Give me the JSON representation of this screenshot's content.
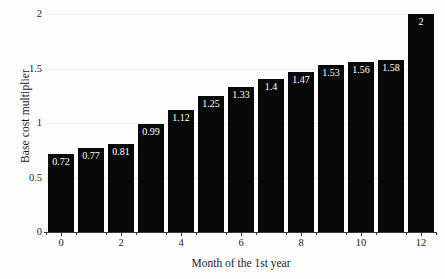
{
  "chart_data": {
    "type": "bar",
    "title": "",
    "xlabel": "Month of the 1st year",
    "ylabel": "Base cost multiplier",
    "categories": [
      0,
      1,
      2,
      3,
      4,
      5,
      6,
      7,
      8,
      9,
      10,
      11,
      12
    ],
    "values": [
      0.72,
      0.77,
      0.81,
      0.99,
      1.12,
      1.25,
      1.33,
      1.4,
      1.47,
      1.53,
      1.56,
      1.58,
      2
    ],
    "value_labels": [
      "0.72",
      "0.77",
      "0.81",
      "0.99",
      "1.12",
      "1.25",
      "1.33",
      "1.4",
      "1.47",
      "1.53",
      "1.56",
      "1.58",
      "2"
    ],
    "ylim": [
      0,
      2
    ],
    "xlim": [
      -0.5,
      12.5
    ],
    "y_ticks": [
      0,
      0.5,
      1,
      1.5,
      2
    ],
    "y_tick_labels": [
      "0",
      "0.5",
      "1",
      "1.5",
      "2"
    ],
    "x_ticks": [
      0,
      2,
      4,
      6,
      8,
      10,
      12
    ],
    "x_tick_labels": [
      "0",
      "2",
      "4",
      "6",
      "8",
      "10",
      "12"
    ],
    "grid": true,
    "grid_axis": "y",
    "legend": false,
    "bar_color": "#080808",
    "bar_label_color": "#ffffff",
    "gridline_color": "#f0f0f0",
    "axis_color": "#3a3a3a",
    "background_color": "#fefefe"
  }
}
